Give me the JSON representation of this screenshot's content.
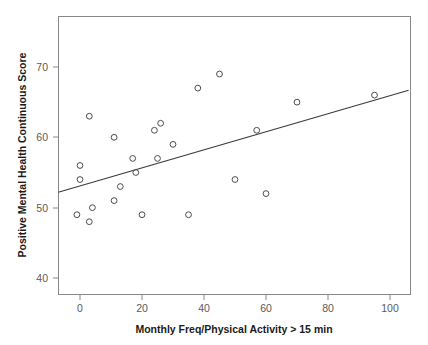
{
  "chart_data": {
    "type": "scatter",
    "title": "",
    "xlabel": "Monthly Freq/Physical Activity > 15 min",
    "ylabel": "Positive Mental Health Continuous Score",
    "xlim": [
      -7,
      106
    ],
    "ylim": [
      36.5,
      76
    ],
    "xticks": [
      0,
      20,
      40,
      60,
      80,
      100
    ],
    "xtick_labels": [
      "0",
      "20",
      "40",
      "60",
      "80",
      "100"
    ],
    "yticks": [
      40,
      50,
      60,
      70
    ],
    "ytick_labels": [
      "40",
      "50",
      "60",
      "70"
    ],
    "grid": false,
    "legend": null,
    "marker": "open-circle",
    "point_color": "#4c4c4c",
    "line_color": "#3a3a3a",
    "points": [
      {
        "x": 0,
        "y": 56
      },
      {
        "x": 0,
        "y": 54
      },
      {
        "x": -1,
        "y": 49
      },
      {
        "x": 3,
        "y": 63
      },
      {
        "x": 3,
        "y": 48
      },
      {
        "x": 4,
        "y": 50
      },
      {
        "x": 11,
        "y": 60
      },
      {
        "x": 11,
        "y": 51
      },
      {
        "x": 13,
        "y": 53
      },
      {
        "x": 17,
        "y": 57
      },
      {
        "x": 18,
        "y": 55
      },
      {
        "x": 20,
        "y": 49
      },
      {
        "x": 24,
        "y": 61
      },
      {
        "x": 25,
        "y": 57
      },
      {
        "x": 26,
        "y": 62
      },
      {
        "x": 30,
        "y": 59
      },
      {
        "x": 35,
        "y": 49
      },
      {
        "x": 38,
        "y": 67
      },
      {
        "x": 45,
        "y": 69
      },
      {
        "x": 50,
        "y": 54
      },
      {
        "x": 57,
        "y": 61
      },
      {
        "x": 60,
        "y": 52
      },
      {
        "x": 70,
        "y": 65
      },
      {
        "x": 95,
        "y": 66
      }
    ],
    "trend_line": {
      "type": "linear-fit",
      "x_start": -7,
      "y_start": 52.2,
      "x_end": 106,
      "y_end": 66.7
    }
  }
}
